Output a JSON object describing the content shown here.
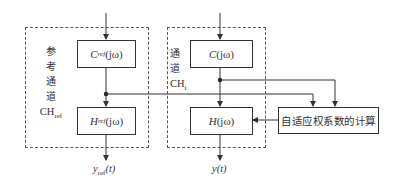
{
  "diagram": {
    "reference_channel": {
      "label_chars": [
        "参",
        "考",
        "通",
        "道"
      ],
      "label_code": "CH",
      "label_code_sub": "ref",
      "top_block": {
        "main": "C",
        "sub": "ref",
        "arg": "(jω)"
      },
      "bottom_block": {
        "main": "H",
        "sub": "ref",
        "arg": "(jω)"
      },
      "output": {
        "main": "y",
        "sub": "ref",
        "arg": "(t)"
      }
    },
    "channel_i": {
      "label_chars": [
        "通",
        "道"
      ],
      "label_code": "CH",
      "label_code_sub": "i",
      "top_block": {
        "main": "C",
        "arg": "(jω)"
      },
      "bottom_block": {
        "main": "H",
        "arg": "(jω)"
      },
      "output": {
        "main": "y",
        "arg": "(t)"
      }
    },
    "adaptive_block": {
      "label": "自适应权系数的计算"
    },
    "colors": {
      "line": "#333333",
      "dash": "#555555",
      "background": "#ffffff"
    }
  }
}
